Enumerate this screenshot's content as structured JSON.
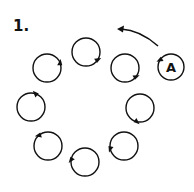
{
  "figure": {
    "number_label": "1.",
    "player_label": "A",
    "stroke_color": "#111111",
    "background": "#ffffff",
    "circle_radius": 14,
    "circles": [
      {
        "name": "circle-top",
        "cx": 86,
        "cy": 52,
        "marker_angle": 45
      },
      {
        "name": "circle-upper-right",
        "cx": 125,
        "cy": 68,
        "marker_angle": 50
      },
      {
        "name": "circle-right",
        "cx": 140,
        "cy": 108,
        "marker_angle": 115
      },
      {
        "name": "circle-lower-right",
        "cx": 124,
        "cy": 146,
        "marker_angle": 180
      },
      {
        "name": "circle-bottom",
        "cx": 85,
        "cy": 162,
        "marker_angle": 200
      },
      {
        "name": "circle-lower-left",
        "cx": 48,
        "cy": 146,
        "marker_angle": 240
      },
      {
        "name": "circle-left",
        "cx": 31,
        "cy": 107,
        "marker_angle": 300
      },
      {
        "name": "circle-upper-left",
        "cx": 47,
        "cy": 68,
        "marker_angle": 350
      }
    ],
    "player": {
      "cx": 171,
      "cy": 67,
      "marker_angle": 225
    },
    "arrow": {
      "from": [
        158,
        46
      ],
      "ctrl": [
        140,
        30
      ],
      "to": [
        117,
        29
      ]
    }
  }
}
